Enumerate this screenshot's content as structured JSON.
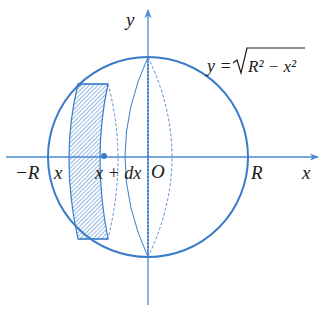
{
  "diagram": {
    "type": "sphere-volume-by-slicing",
    "colors": {
      "stroke": "#3a7cc8",
      "axis": "#4a8ad6",
      "hatch": "#3a7cc8",
      "text": "#1a1a1a"
    },
    "axes": {
      "x_label": "x",
      "y_label": "y",
      "origin_label": "O"
    },
    "tick_labels": {
      "neg_r": "−R",
      "pos_r": "R",
      "x": "x",
      "x_plus_dx": "x + dx"
    },
    "curve_label": {
      "prefix": "y =",
      "radicand": "R² − x²"
    },
    "circle": {
      "cx": 148,
      "cy": 157,
      "r": 100
    },
    "slice": {
      "x_left": 78,
      "x_right": 108,
      "y_top": 84,
      "y_bottom": 239,
      "marker_x": 103
    }
  }
}
